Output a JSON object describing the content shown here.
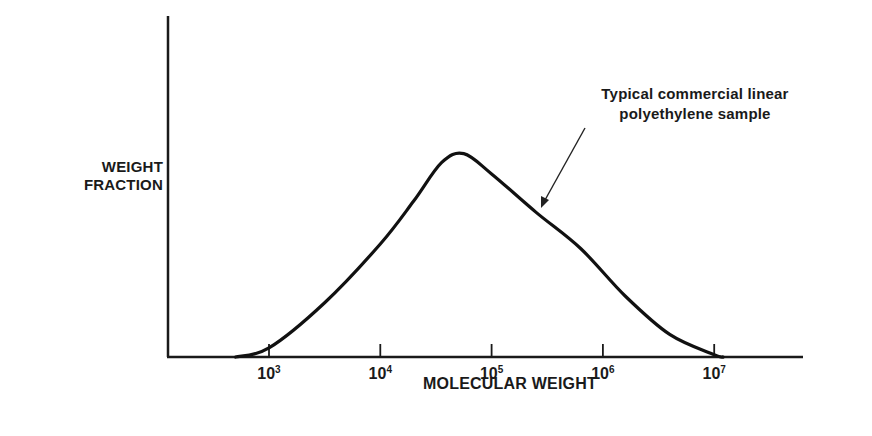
{
  "chart_data": {
    "type": "line",
    "title": "",
    "xlabel": "MOLECULAR WEIGHT",
    "ylabel": "WEIGHT FRACTION",
    "x_scale": "log",
    "x_ticks": [
      {
        "base": "10",
        "exp": "3",
        "value": 1000
      },
      {
        "base": "10",
        "exp": "4",
        "value": 10000
      },
      {
        "base": "10",
        "exp": "5",
        "value": 100000
      },
      {
        "base": "10",
        "exp": "6",
        "value": 1000000
      },
      {
        "base": "10",
        "exp": "7",
        "value": 10000000
      }
    ],
    "y_ticks": [],
    "grid": false,
    "legend": null,
    "annotation": {
      "line1": "Typical commercial linear",
      "line2": "polyethylene sample"
    },
    "series": [
      {
        "name": "Typical commercial linear polyethylene sample",
        "log10_x": [
          2.7,
          3.0,
          3.5,
          4.0,
          4.3,
          4.55,
          4.75,
          5.0,
          5.4,
          5.8,
          6.2,
          6.6,
          7.0,
          7.08
        ],
        "relative_y": [
          0.0,
          0.04,
          0.24,
          0.5,
          0.69,
          0.86,
          0.9,
          0.81,
          0.64,
          0.48,
          0.27,
          0.1,
          0.01,
          0.0
        ]
      }
    ]
  }
}
